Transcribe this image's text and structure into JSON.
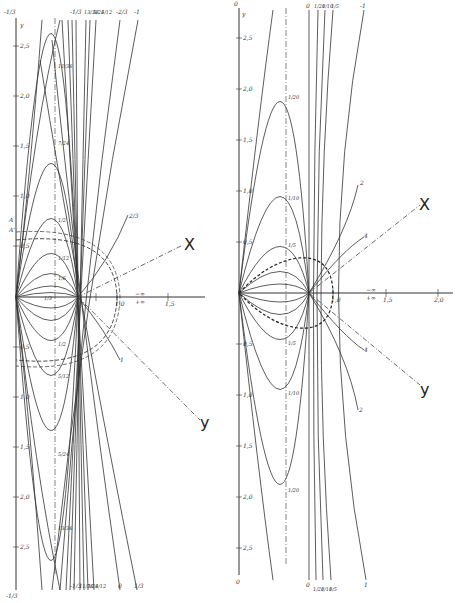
{
  "left_panel": {
    "axis_y_label": "y",
    "axis_x_labels": [
      "1,0",
      "1,5"
    ],
    "infinity_labels": [
      "−∞",
      "+∞"
    ],
    "y_ticks_pos": [
      "2,5",
      "2,0",
      "1,5",
      "1,0",
      "0,5"
    ],
    "y_ticks_neg": [
      "0,5",
      "1,0",
      "1,5",
      "2,0",
      "2,5"
    ],
    "top_labels": [
      "-1/3",
      "-1/3",
      "13/36",
      "5/24",
      "5/12",
      "-2/3",
      "-1"
    ],
    "bottom_labels": [
      "-1/3",
      "-1/3",
      "11/36",
      "7/24",
      "3/12",
      "0",
      "1/3"
    ],
    "apex_labels_top": [
      "11/36",
      "7/24",
      "1/2",
      "1/12",
      "1/6"
    ],
    "apex_labels_bottom": [
      "1/2",
      "5/12",
      "5/24",
      "13/36"
    ],
    "side_labels": [
      "2/3",
      "1"
    ],
    "marks": [
      "A",
      "A'"
    ],
    "origin_label": "1/3",
    "ray_x": "X",
    "ray_y": "y"
  },
  "right_panel": {
    "axis_y_label": "y",
    "axis_top_label": "0",
    "axis_bottom_label": "0",
    "axis_x_labels": [
      "1,0",
      "1,5",
      "2,0"
    ],
    "infinity_labels": [
      "−∞",
      "+∞"
    ],
    "y_ticks_pos": [
      "2,5",
      "2,0",
      "1,5",
      "1,0",
      "0,5"
    ],
    "y_ticks_neg": [
      "0,5",
      "1,0",
      "1,5",
      "2,0",
      "2,5"
    ],
    "top_labels": [
      "0",
      "1/20",
      "1/10",
      "1/5",
      "-1"
    ],
    "bottom_labels": [
      "0",
      "1/20",
      "1/10",
      "1/5",
      "1"
    ],
    "apex_labels_top": [
      "1/20",
      "1/10",
      "1/5"
    ],
    "apex_labels_bottom": [
      "1/5",
      "1/10",
      "1/20"
    ],
    "side_labels": [
      "2",
      "4",
      "4",
      "2"
    ],
    "ray_x": "X",
    "ray_y": "y"
  }
}
